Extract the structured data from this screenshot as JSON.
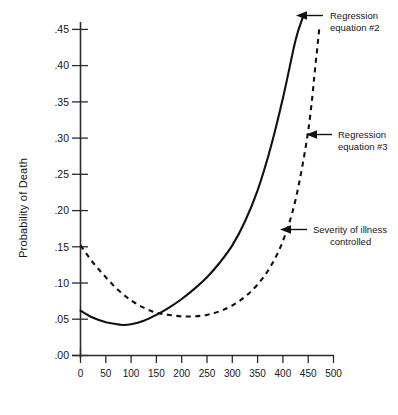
{
  "chart_data": {
    "type": "line",
    "title": "",
    "xlabel": "",
    "ylabel": "Probability of Death",
    "xlim": [
      0,
      500
    ],
    "ylim": [
      0.0,
      0.47
    ],
    "grid": false,
    "legend_position": "inline-annotations",
    "x_ticks": [
      "0",
      "50",
      "100",
      "150",
      "200",
      "250",
      "300",
      "350",
      "400",
      "450",
      "500"
    ],
    "x_tick_values": [
      0,
      50,
      100,
      150,
      200,
      250,
      300,
      350,
      400,
      450,
      500
    ],
    "y_ticks": [
      ".00",
      ".05",
      ".10",
      ".15",
      ".20",
      ".25",
      ".30",
      ".35",
      ".40",
      ".45"
    ],
    "y_tick_values": [
      0.0,
      0.05,
      0.1,
      0.15,
      0.2,
      0.25,
      0.3,
      0.35,
      0.4,
      0.45
    ],
    "series": [
      {
        "name": "Regression equation #2",
        "style": "solid",
        "x": [
          0,
          25,
          50,
          75,
          85,
          100,
          125,
          150,
          175,
          200,
          225,
          250,
          275,
          300,
          325,
          350,
          375,
          400,
          425,
          440
        ],
        "values": [
          0.062,
          0.052,
          0.046,
          0.043,
          0.042,
          0.043,
          0.048,
          0.056,
          0.066,
          0.078,
          0.092,
          0.108,
          0.128,
          0.152,
          0.185,
          0.228,
          0.285,
          0.355,
          0.435,
          0.468
        ]
      },
      {
        "name": "Regression equation #3",
        "style": "dashed",
        "x": [
          0,
          25,
          50,
          75,
          100,
          125,
          150,
          175,
          200,
          225,
          250,
          275,
          300,
          325,
          350,
          375,
          400,
          425,
          450,
          465,
          472
        ],
        "values": [
          0.152,
          0.128,
          0.108,
          0.09,
          0.076,
          0.066,
          0.059,
          0.056,
          0.054,
          0.054,
          0.056,
          0.061,
          0.069,
          0.081,
          0.098,
          0.122,
          0.158,
          0.215,
          0.31,
          0.405,
          0.452
        ]
      }
    ],
    "annotations": [
      {
        "id": "annotation-regression-2",
        "line1": "Regression",
        "line2": "equation #2",
        "arrow": "left-arrow-icon"
      },
      {
        "id": "annotation-regression-3",
        "line1": "Regression",
        "line2": "equation #3",
        "arrow": "left-arrow-icon"
      },
      {
        "id": "annotation-severity",
        "line1": "Severity of illness",
        "line2": "controlled",
        "arrow": "left-arrow-icon"
      }
    ],
    "colors": {
      "curve": "#111111",
      "axis": "#2b2b2b",
      "text": "#161616",
      "background": "#ffffff"
    }
  }
}
